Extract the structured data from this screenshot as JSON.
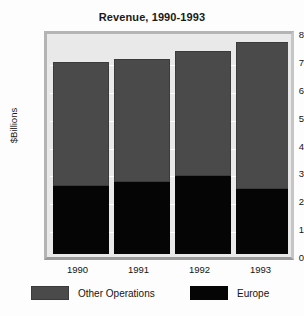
{
  "chart_data": {
    "type": "bar",
    "subtype": "stacked",
    "title": "Revenue, 1990-1993",
    "xlabel": "",
    "ylabel": "$Billions",
    "categories": [
      "1990",
      "1991",
      "1992",
      "1993"
    ],
    "series": [
      {
        "name": "Europe",
        "color": "#050505",
        "values": [
          2.45,
          2.6,
          2.8,
          2.35
        ]
      },
      {
        "name": "Other Operations",
        "color": "#4a4a4a",
        "values": [
          4.45,
          4.4,
          4.5,
          5.25
        ]
      }
    ],
    "totals": [
      6.9,
      7.0,
      7.3,
      7.6
    ],
    "ylim": [
      0,
      8
    ],
    "ytick_labels": [
      "8",
      "7",
      "6",
      "5",
      "4",
      "3",
      "2",
      "1",
      "0"
    ],
    "ytick_values": [
      8,
      7,
      6,
      5,
      4,
      3,
      2,
      1,
      0
    ],
    "grid": true,
    "legend_position": "bottom"
  },
  "legend": {
    "items": [
      {
        "label": "Other Operations",
        "color": "#4a4a4a"
      },
      {
        "label": "Europe",
        "color": "#050505"
      }
    ]
  },
  "colors": {
    "plot_background": "#e9e9e9",
    "plot_border": "#b4b4b4",
    "gridline": "#ffffff",
    "text": "#141414",
    "other_operations": "#4a4a4a",
    "europe": "#050505"
  }
}
